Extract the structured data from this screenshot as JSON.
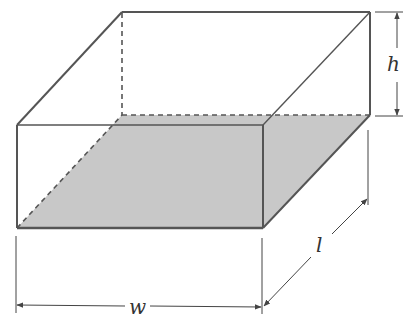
{
  "diagram": {
    "type": "rectangular-box-3d",
    "colors": {
      "edge": "#555555",
      "hidden_edge": "#555555",
      "base_fill": "#c8c8c8",
      "dimension_line": "#444444",
      "label": "#333333"
    },
    "labels": {
      "height": "h",
      "width": "w",
      "length": "l"
    },
    "edges": {
      "visible": [
        "front-face",
        "top-back-edge",
        "top-left-edge",
        "top-right-edge",
        "right-back-vertical",
        "right-bottom-edge"
      ],
      "hidden": [
        "back-left-vertical",
        "back-bottom-edge",
        "left-bottom-diagonal"
      ]
    }
  }
}
